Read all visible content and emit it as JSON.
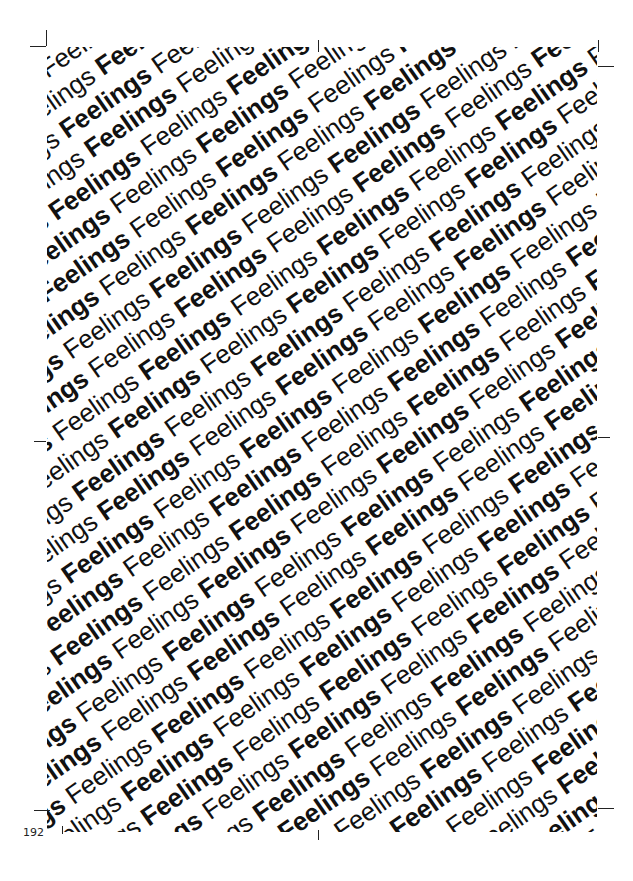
{
  "page": {
    "number": "192",
    "pattern_word": "Feelings",
    "pattern_rows": 46,
    "pattern_repeats_per_row": 14,
    "rotation_deg": -35,
    "text_color": "#111111",
    "background": "#ffffff"
  }
}
